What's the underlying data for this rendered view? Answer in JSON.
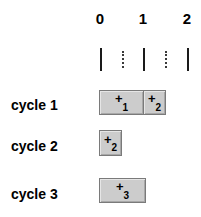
{
  "figure": {
    "type": "timing-diagram",
    "background_color": "#ffffff",
    "box_fill_color": "#cccccc",
    "box_border_color": "#7a7a7a",
    "text_color": "#000000"
  },
  "axis": {
    "name": "time-axis",
    "ticks": [
      {
        "label": "0",
        "x": 100,
        "kind": "major"
      },
      {
        "label": "",
        "x": 122,
        "kind": "minor"
      },
      {
        "label": "1",
        "x": 143,
        "kind": "major"
      },
      {
        "label": "",
        "x": 165,
        "kind": "minor"
      },
      {
        "label": "2",
        "x": 187,
        "kind": "major"
      }
    ],
    "labels": [
      {
        "text": "0",
        "x": 100
      },
      {
        "text": "1",
        "x": 143
      },
      {
        "text": "2",
        "x": 187
      }
    ]
  },
  "rows": [
    {
      "label": "cycle 1",
      "label_y": 97,
      "boxes": [
        {
          "op": "+",
          "sub": "1",
          "x": 99,
          "y": 90,
          "width": 45,
          "height": 25
        },
        {
          "op": "+",
          "sub": "2",
          "x": 143,
          "y": 90,
          "width": 23,
          "height": 25
        }
      ]
    },
    {
      "label": "cycle 2",
      "label_y": 138,
      "boxes": [
        {
          "op": "+",
          "sub": "2",
          "x": 99,
          "y": 130,
          "width": 23,
          "height": 26
        }
      ]
    },
    {
      "label": "cycle 3",
      "label_y": 186,
      "boxes": [
        {
          "op": "+",
          "sub": "3",
          "x": 99,
          "y": 178,
          "width": 47,
          "height": 25
        }
      ]
    }
  ]
}
